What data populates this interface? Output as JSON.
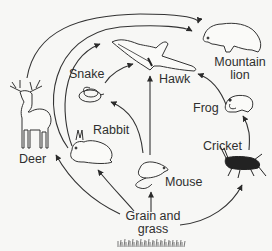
{
  "diagram": {
    "type": "food-web",
    "organisms": {
      "mountain_lion": {
        "label_line1": "Mountain",
        "label_line2": "lion",
        "icon": "mountain-lion-icon"
      },
      "hawk": {
        "label": "Hawk",
        "icon": "hawk-icon"
      },
      "snake": {
        "label": "Snake",
        "icon": "snake-icon"
      },
      "frog": {
        "label": "Frog",
        "icon": "frog-icon"
      },
      "deer": {
        "label": "Deer",
        "icon": "deer-icon"
      },
      "rabbit": {
        "label": "Rabbit",
        "icon": "rabbit-icon"
      },
      "cricket": {
        "label": "Cricket",
        "icon": "cricket-icon"
      },
      "mouse": {
        "label": "Mouse",
        "icon": "mouse-icon"
      },
      "grain": {
        "label_line1": "Grain and",
        "label_line2": "grass",
        "icon": "grass-icon"
      }
    },
    "edges": [
      {
        "from": "Grain and grass",
        "to": "Deer"
      },
      {
        "from": "Grain and grass",
        "to": "Rabbit"
      },
      {
        "from": "Grain and grass",
        "to": "Mouse"
      },
      {
        "from": "Grain and grass",
        "to": "Cricket"
      },
      {
        "from": "Deer",
        "to": "Mountain lion"
      },
      {
        "from": "Rabbit",
        "to": "Mountain lion"
      },
      {
        "from": "Rabbit",
        "to": "Hawk"
      },
      {
        "from": "Mouse",
        "to": "Snake"
      },
      {
        "from": "Mouse",
        "to": "Hawk"
      },
      {
        "from": "Snake",
        "to": "Hawk"
      },
      {
        "from": "Cricket",
        "to": "Frog"
      },
      {
        "from": "Frog",
        "to": "Hawk"
      }
    ]
  }
}
